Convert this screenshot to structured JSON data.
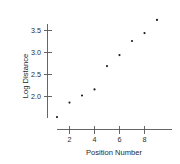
{
  "top_caption": {
    "text": "Number of the Months"
  },
  "chart_data": {
    "type": "scatter",
    "title": "",
    "xlabel": "Position Number",
    "ylabel": "Log Distance",
    "x": [
      1,
      2,
      3,
      4,
      5,
      6,
      7,
      8,
      9
    ],
    "values": [
      1.52,
      1.85,
      2.01,
      2.15,
      2.68,
      2.93,
      3.25,
      3.43,
      3.73
    ],
    "xlim": [
      0.4,
      10.2
    ],
    "ylim": [
      1.4,
      3.85
    ],
    "xticks": [
      2,
      4,
      6,
      8
    ],
    "xticklabels": [
      "2",
      "4",
      "6",
      "8"
    ],
    "yticks": [
      2.0,
      2.5,
      3.0,
      3.5
    ],
    "yticklabels": [
      "2.0",
      "2.5",
      "3.0",
      "3.5"
    ],
    "grid": false,
    "legend": null,
    "marker": "point",
    "marker_color": "#1a1a1a"
  },
  "colors": {
    "background": "#ffffff",
    "axis": "#555555",
    "text": "#2b2b2b",
    "marker": "#1a1a1a"
  }
}
